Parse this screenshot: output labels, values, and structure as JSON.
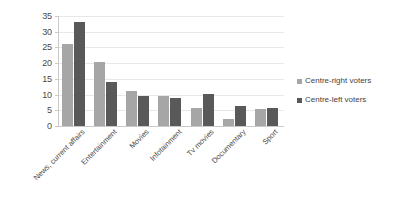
{
  "chart_data": {
    "type": "bar",
    "title": "",
    "subtitle": "",
    "xlabel": "",
    "ylabel": "",
    "ylim": [
      0,
      35
    ],
    "ytick_step": 5,
    "yticks": [
      "35",
      "30",
      "25",
      "20",
      "15",
      "10",
      "5",
      "0"
    ],
    "grid": true,
    "grid_axis": "y",
    "legend_position": "right",
    "categories": [
      "News, current affairs",
      "Entertainment",
      "Movies",
      "Infotainment",
      "Tv movies",
      "Documentary",
      "Sport"
    ],
    "series": [
      {
        "name": "Centre-right voters",
        "color": "#a6a6a6",
        "values": [
          26,
          20.4,
          11.2,
          9.4,
          5.7,
          2.1,
          5.5
        ]
      },
      {
        "name": "Centre-left voters",
        "color": "#595959",
        "values": [
          33.1,
          13.9,
          9.6,
          8.9,
          10.2,
          6.5,
          5.6
        ]
      }
    ]
  },
  "colors": {
    "series_right": "#a6a6a6",
    "series_left": "#595959",
    "gridline": "#e8e8e8",
    "axis": "#c9c9c9",
    "text": "#4a4a4a",
    "background": "#ffffff"
  }
}
